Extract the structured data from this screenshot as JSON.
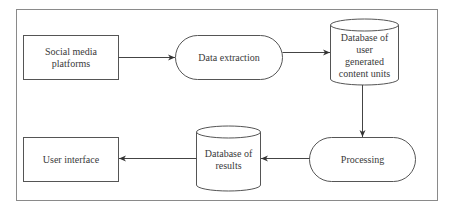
{
  "diagram": {
    "type": "flowchart",
    "nodes": [
      {
        "id": "social",
        "shape": "rectangle",
        "label": "Social media\nplatforms"
      },
      {
        "id": "extract",
        "shape": "terminal",
        "label": "Data extraction"
      },
      {
        "id": "db_ugc",
        "shape": "cylinder",
        "label": "Database of\nuser\ngenerated\ncontent units"
      },
      {
        "id": "process",
        "shape": "terminal",
        "label": "Processing"
      },
      {
        "id": "db_results",
        "shape": "cylinder",
        "label": "Database of\nresults"
      },
      {
        "id": "ui",
        "shape": "rectangle",
        "label": "User interface"
      }
    ],
    "edges": [
      {
        "from": "social",
        "to": "extract"
      },
      {
        "from": "extract",
        "to": "db_ugc"
      },
      {
        "from": "db_ugc",
        "to": "process"
      },
      {
        "from": "process",
        "to": "db_results"
      },
      {
        "from": "db_results",
        "to": "ui"
      }
    ],
    "colors": {
      "stroke": "#555555",
      "text": "#3a3a3a",
      "frame": "#8a8a8a"
    }
  }
}
